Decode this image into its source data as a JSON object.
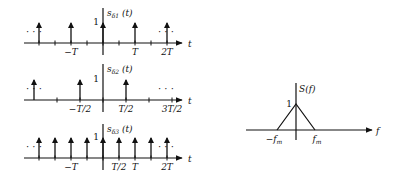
{
  "panels": [
    {
      "id": "s-delta-1",
      "ylabel": "s",
      "ysub": "δ1",
      "yarg": "(t)",
      "xlabel": "t",
      "peak_label": "1",
      "impulse_spacing_in_T": 1,
      "impulse_positions_in_T": [
        -2,
        -1,
        0,
        1,
        2
      ],
      "tick_labels": [
        {
          "pos_in_T": -1,
          "text": "−T"
        },
        {
          "pos_in_T": 1,
          "text": "T"
        },
        {
          "pos_in_T": 2,
          "text": "2T"
        }
      ],
      "ellipsis": "· · ·"
    },
    {
      "id": "s-delta-2",
      "ylabel": "s",
      "ysub": "δ2",
      "yarg": "(t)",
      "xlabel": "t",
      "peak_label": "1",
      "impulse_spacing_in_T": 1,
      "impulse_positions_in_T": [
        -2.5,
        -1.5,
        -0.5,
        0.5,
        1.5,
        2.5
      ],
      "tick_labels": [
        {
          "pos_in_T": -0.5,
          "text": "−T/2"
        },
        {
          "pos_in_T": 0.5,
          "text": "T/2"
        },
        {
          "pos_in_T": 1.5,
          "text": "3T/2"
        }
      ],
      "ellipsis": "· · ·"
    },
    {
      "id": "s-delta-3",
      "ylabel": "s",
      "ysub": "δ3",
      "yarg": "(t)",
      "xlabel": "t",
      "peak_label": "1",
      "impulse_spacing_in_T": 0.5,
      "impulse_positions_in_T": [
        -2.5,
        -2,
        -1.5,
        -1,
        -0.5,
        0,
        0.5,
        1,
        1.5,
        2,
        2.5
      ],
      "tick_labels": [
        {
          "pos_in_T": -1,
          "text": "−T"
        },
        {
          "pos_in_T": 0.5,
          "text": "T/2"
        },
        {
          "pos_in_T": 1,
          "text": "T"
        },
        {
          "pos_in_T": 2,
          "text": "2T"
        }
      ],
      "ellipsis": "· · ·"
    }
  ],
  "spectrum": {
    "ylabel": "S(f)",
    "xlabel": "f",
    "peak_label": "1",
    "left_label": "−f",
    "right_label": "f",
    "sub": "m",
    "shape": "triangle",
    "peak_value": 1,
    "support": [
      "-fm",
      "fm"
    ]
  }
}
